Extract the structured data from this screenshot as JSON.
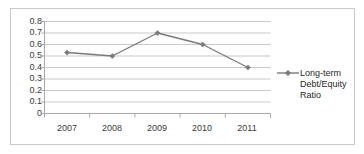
{
  "chart_data": {
    "type": "line",
    "title": "",
    "xlabel": "",
    "ylabel": "",
    "categories": [
      "2007",
      "2008",
      "2009",
      "2010",
      "2011"
    ],
    "series": [
      {
        "name": "Long-term Debt/Equity Ratio",
        "values": [
          0.53,
          0.5,
          0.7,
          0.6,
          0.4
        ]
      }
    ],
    "ylim": [
      0,
      0.8
    ],
    "ytick_labels": [
      "0.8",
      "0.7",
      "0.6",
      "0.5",
      "0.4",
      "0.3",
      "0.2",
      "0.1",
      "0"
    ],
    "ytick_values": [
      0.8,
      0.7,
      0.6,
      0.5,
      0.4,
      0.3,
      0.2,
      0.1,
      0
    ],
    "grid": true,
    "grid_axis": "y",
    "legend_position": "right",
    "series_color": "#7a7a7a",
    "grid_color": "#c9c9c9",
    "axis_color": "#a8a8a8",
    "text_color": "#3a3a3a",
    "marker": "diamond"
  },
  "legend": {
    "entries": [
      {
        "label_lines": [
          "Long-term",
          "Debt/Equity",
          "Ratio"
        ],
        "marker": "diamond-with-line",
        "color": "#7a7a7a"
      }
    ]
  },
  "ticks": {
    "y": {
      "l0": "0.8",
      "l1": "0.7",
      "l2": "0.6",
      "l3": "0.5",
      "l4": "0.4",
      "l5": "0.3",
      "l6": "0.2",
      "l7": "0.1",
      "l8": "0"
    },
    "x": {
      "l0": "2007",
      "l1": "2008",
      "l2": "2009",
      "l3": "2010",
      "l4": "2011"
    }
  },
  "legend_text": {
    "line0": "Long-term",
    "line1": "Debt/Equity",
    "line2": "Ratio"
  }
}
